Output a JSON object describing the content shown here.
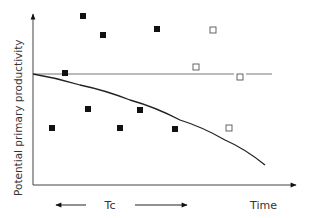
{
  "chart_data": {
    "type": "scatter",
    "title": "",
    "xlabel": "Time",
    "ylabel": "Potential primary productivity",
    "annotations": [
      {
        "text": "Tc",
        "type": "double-headed-arrow-span",
        "from_x": 55,
        "to_x": 188,
        "y": 205
      }
    ],
    "grid": false,
    "legend": null,
    "axes": {
      "origin": [
        33,
        185
      ],
      "y_axis_top": 13,
      "x_axis_right": 297
    },
    "reference_line": {
      "type": "horizontal",
      "y": 74,
      "x_start": 33,
      "x_end": 272
    },
    "curve": {
      "type": "declining-curve",
      "points": [
        [
          33,
          74
        ],
        [
          80,
          85
        ],
        [
          130,
          100
        ],
        [
          180,
          120
        ],
        [
          225,
          140
        ],
        [
          265,
          165
        ]
      ]
    },
    "series": [
      {
        "name": "filled squares",
        "marker": "filled-square",
        "color": "#111111",
        "points": [
          [
            83,
            16
          ],
          [
            103,
            35
          ],
          [
            157,
            29
          ],
          [
            65,
            73
          ],
          [
            52,
            128
          ],
          [
            88,
            109
          ],
          [
            120,
            128
          ],
          [
            140,
            110
          ],
          [
            175,
            129
          ]
        ]
      },
      {
        "name": "open squares",
        "marker": "open-square",
        "color": "#555555",
        "points": [
          [
            213,
            30
          ],
          [
            196,
            67
          ],
          [
            240,
            77
          ],
          [
            229,
            128
          ]
        ]
      }
    ]
  },
  "labels": {
    "y_axis": "Potential primary productivity",
    "x_axis": "Time",
    "tc": "Tc"
  }
}
